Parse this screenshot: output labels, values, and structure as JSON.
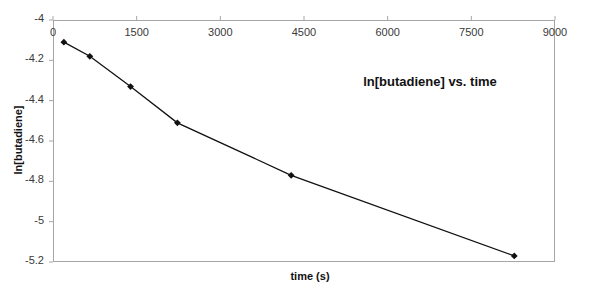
{
  "chart_data": {
    "type": "line",
    "title": "ln[butadiene] vs. time",
    "xlabel": "time (s)",
    "ylabel": "ln[butadiene]",
    "xlim": [
      0,
      9000
    ],
    "ylim": [
      -5.2,
      -4.0
    ],
    "xticks": [
      0,
      1500,
      3000,
      4500,
      6000,
      7500,
      9000
    ],
    "xticklabels": [
      "0",
      "1500",
      "3000",
      "4500",
      "6000",
      "7500",
      "9000"
    ],
    "yticks": [
      -4.0,
      -4.2,
      -4.4,
      -4.6,
      -4.8,
      -5.0,
      -5.2
    ],
    "yticklabels": [
      "-4",
      "-4.2",
      "-4.4",
      "-4.6",
      "-4.8",
      "-5",
      "-5.2"
    ],
    "grid": false,
    "legend": "none",
    "x": [
      195,
      660,
      1390,
      2230,
      4270,
      8270
    ],
    "y": [
      -4.11,
      -4.18,
      -4.33,
      -4.51,
      -4.77,
      -5.17
    ],
    "series": [
      {
        "name": "ln[butadiene]",
        "marker": "diamond",
        "marker_color": "#111111",
        "line_color": "#111111",
        "values": [
          -4.11,
          -4.18,
          -4.33,
          -4.51,
          -4.77,
          -5.17
        ]
      }
    ]
  },
  "colors": {
    "axis": "#a6a6a6",
    "data": "#111111",
    "ticklabel": "#3a3a3a",
    "background": "#ffffff"
  }
}
